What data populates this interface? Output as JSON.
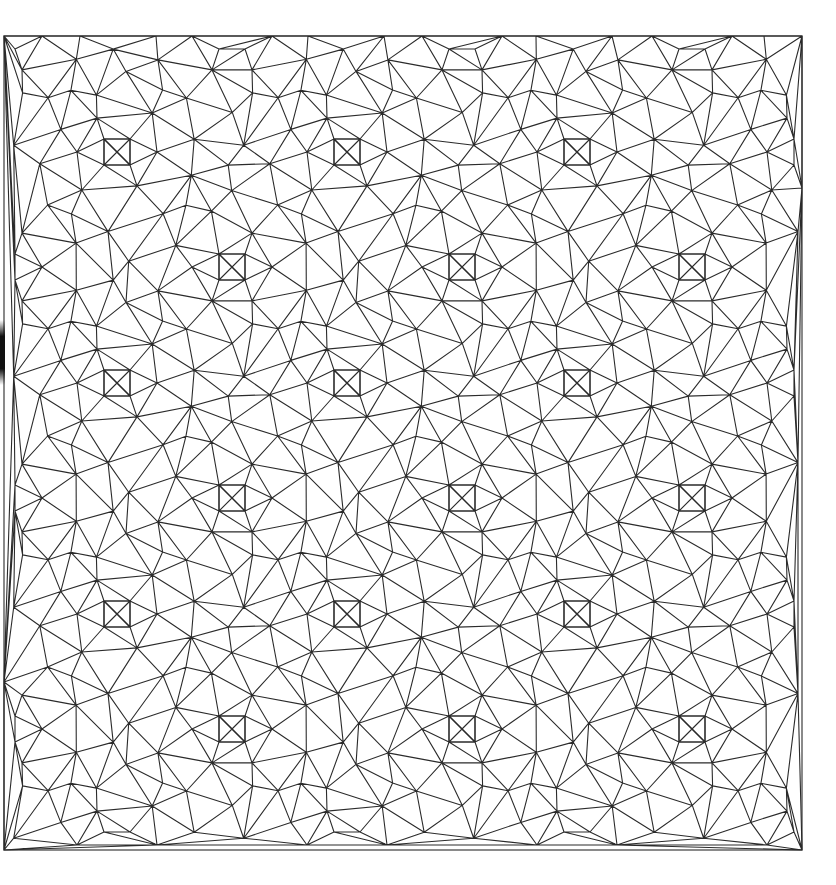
{
  "diagram": {
    "type": "triangular-mesh",
    "frame": {
      "x0": 4,
      "y0": 36,
      "x1": 802,
      "y1": 850
    },
    "line_color": "#2b2b2b",
    "background": "#ffffff",
    "lattice": {
      "period_x": 230,
      "period_y": 231,
      "origin_a": [
        117,
        152
      ],
      "origin_b": [
        232,
        267
      ],
      "square_half": 13
    },
    "rings": [
      {
        "r": 40,
        "n": 6,
        "phase": 0.0
      },
      {
        "r": 78,
        "n": 10,
        "phase": 0.31
      },
      {
        "r": 112,
        "n": 14,
        "phase": 0.12
      }
    ],
    "left_edge_shadow": {
      "y0": 320,
      "y1": 385,
      "color": "#111111"
    }
  }
}
